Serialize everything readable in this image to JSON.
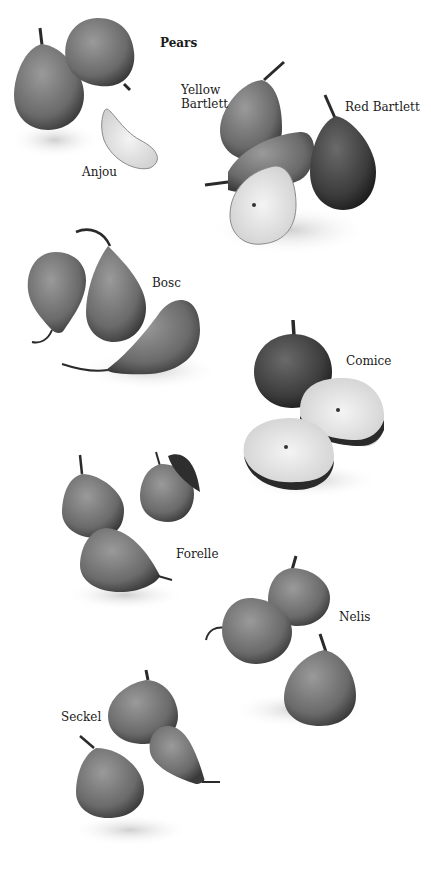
{
  "title": "Pears",
  "varieties": [
    {
      "name": "Anjou",
      "label": "Anjou"
    },
    {
      "name": "Yellow Bartlett",
      "label": "Yellow\nBartlett"
    },
    {
      "name": "Red Bartlett",
      "label": "Red Bartlett"
    },
    {
      "name": "Bosc",
      "label": "Bosc"
    },
    {
      "name": "Comice",
      "label": "Comice"
    },
    {
      "name": "Forelle",
      "label": "Forelle"
    },
    {
      "name": "Nelis",
      "label": "Nelis"
    },
    {
      "name": "Seckel",
      "label": "Seckel"
    }
  ]
}
